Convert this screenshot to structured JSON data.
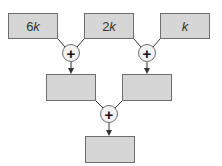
{
  "diagram": {
    "title": "",
    "inputs": [
      {
        "coef": "6",
        "var": "k"
      },
      {
        "coef": "2",
        "var": "k"
      },
      {
        "coef": "",
        "var": "k"
      }
    ],
    "intermediate": [
      {
        "label": ""
      },
      {
        "label": ""
      }
    ],
    "output": {
      "label": ""
    },
    "operators": [
      {
        "symbol": "+",
        "icon": "plus-icon"
      },
      {
        "symbol": "+",
        "icon": "plus-icon"
      },
      {
        "symbol": "+",
        "icon": "plus-icon"
      }
    ],
    "colors": {
      "box_fill": "#d6d6d6",
      "box_border": "#6e6e6e",
      "circle_fill": "#f2f2f2",
      "line": "#333333"
    }
  }
}
